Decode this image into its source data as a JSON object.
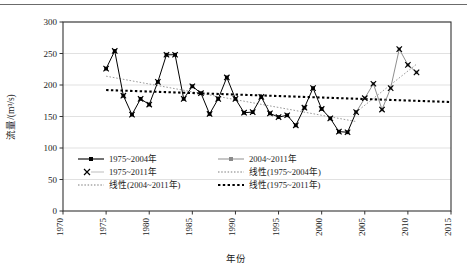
{
  "figure": {
    "background_color": "#ffffff",
    "top_rule_color": "#6b6b6b",
    "plot_border_color": "#333333",
    "gridline_color": "#d9d9d9"
  },
  "axes": {
    "x_title": "年份",
    "y_title": "流量/(m³/s)",
    "x_ticks": [
      "1970",
      "1975",
      "1980",
      "1985",
      "1990",
      "1995",
      "2000",
      "2005",
      "2010",
      "2015"
    ],
    "y_ticks": [
      "0",
      "50",
      "100",
      "150",
      "200",
      "250",
      "300"
    ],
    "xlim": [
      1970,
      2015
    ],
    "ylim": [
      0,
      300
    ]
  },
  "legend": {
    "entries": [
      {
        "label": "1975~2004年",
        "marker": "square-line",
        "style": "solid-black-marker"
      },
      {
        "label": "2004~2011年",
        "marker": "square-line",
        "style": "solid-gray-marker"
      },
      {
        "label": "1975~2011年",
        "marker": "cross",
        "style": "cross-gray-line"
      },
      {
        "label": "线性(1975~2004年)",
        "marker": "dotted-thin",
        "style": "dotted-gray"
      },
      {
        "label": "线性(2004~2011年)",
        "marker": "dotted-thin",
        "style": "dotted-gray"
      },
      {
        "label": "线性(1975~2011年)",
        "marker": "dotted-thick",
        "style": "dotted-black-thick"
      }
    ]
  },
  "chart_data": {
    "type": "line",
    "title": "",
    "xlabel": "年份",
    "ylabel": "流量/(m³/s)",
    "xlim": [
      1970,
      2015
    ],
    "ylim": [
      0,
      300
    ],
    "ytick_step": 50,
    "xtick_step": 5,
    "grid": "horizontal",
    "legend_position": "inside-lower-left",
    "series": [
      {
        "name": "1975~2004年",
        "marker": "filled-square",
        "line": "solid",
        "color": "#000000",
        "x": [
          1975,
          1976,
          1977,
          1978,
          1979,
          1980,
          1981,
          1982,
          1983,
          1984,
          1985,
          1986,
          1987,
          1988,
          1989,
          1990,
          1991,
          1992,
          1993,
          1994,
          1995,
          1996,
          1997,
          1998,
          1999,
          2000,
          2001,
          2002,
          2003,
          2004
        ],
        "values": [
          226,
          254,
          183,
          153,
          178,
          169,
          205,
          248,
          248,
          178,
          198,
          187,
          154,
          178,
          212,
          178,
          156,
          157,
          181,
          155,
          149,
          152,
          136,
          164,
          195,
          162,
          147,
          126,
          125,
          157
        ]
      },
      {
        "name": "2004~2011年",
        "marker": "filled-square-gray",
        "line": "solid-gray",
        "color": "#8f8f8f",
        "x": [
          2004,
          2005,
          2006,
          2007,
          2008,
          2009,
          2010,
          2011
        ],
        "values": [
          157,
          179,
          202,
          161,
          195,
          257,
          232,
          220
        ]
      },
      {
        "name": "1975~2011年",
        "marker": "cross",
        "line": "none",
        "color": "#000000",
        "x": [
          1975,
          1976,
          1977,
          1978,
          1979,
          1980,
          1981,
          1982,
          1983,
          1984,
          1985,
          1986,
          1987,
          1988,
          1989,
          1990,
          1991,
          1992,
          1993,
          1994,
          1995,
          1996,
          1997,
          1998,
          1999,
          2000,
          2001,
          2002,
          2003,
          2004,
          2005,
          2006,
          2007,
          2008,
          2009,
          2010,
          2011
        ],
        "values": [
          226,
          254,
          183,
          153,
          178,
          169,
          205,
          248,
          248,
          178,
          198,
          187,
          154,
          178,
          212,
          178,
          156,
          157,
          181,
          155,
          149,
          152,
          136,
          164,
          195,
          162,
          147,
          126,
          125,
          157,
          179,
          202,
          161,
          195,
          257,
          232,
          220
        ]
      }
    ],
    "trendlines": [
      {
        "name": "线性(1975~2004年)",
        "style": "dotted-thin-gray",
        "color": "#8f8f8f",
        "x": [
          1975,
          2004
        ],
        "values": [
          214,
          142
        ]
      },
      {
        "name": "线性(2004~2011年)",
        "style": "dotted-thin-gray",
        "color": "#8f8f8f",
        "x": [
          2004,
          2011
        ],
        "values": [
          157,
          233
        ]
      },
      {
        "name": "线性(1975~2011年)",
        "style": "dotted-thick-black",
        "color": "#000000",
        "x": [
          1975,
          2015
        ],
        "values": [
          192,
          173
        ]
      }
    ]
  }
}
